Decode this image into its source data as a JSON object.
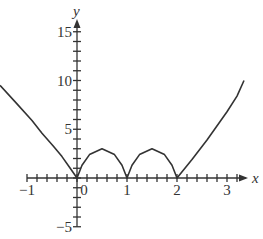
{
  "chart_data": {
    "type": "line",
    "title": "",
    "xlabel": "x",
    "ylabel": "y",
    "xlim": [
      -1.55,
      3.4
    ],
    "ylim": [
      -5.2,
      16.3
    ],
    "grid": false,
    "x_ticks": [
      -1,
      0,
      1,
      2,
      3
    ],
    "x_tick_labels": [
      "−1",
      "0",
      "1",
      "2",
      "3"
    ],
    "x_minor_tick_step": 0.2,
    "y_ticks": [
      -5,
      5,
      10,
      15
    ],
    "y_tick_labels": [
      "−5",
      "5",
      "10",
      "15"
    ],
    "y_minor_tick_step": 1,
    "series": [
      {
        "name": "f(x)",
        "color": "#333333",
        "points": [
          [
            -1.54,
            9.5
          ],
          [
            -1.2,
            7.6
          ],
          [
            -0.9,
            5.9
          ],
          [
            -0.7,
            4.6
          ],
          [
            -0.48,
            3.3
          ],
          [
            -0.3,
            2.2
          ],
          [
            -0.15,
            1.1
          ],
          [
            0,
            0
          ],
          [
            0.1,
            1.3
          ],
          [
            0.25,
            2.4
          ],
          [
            0.5,
            3.0
          ],
          [
            0.75,
            2.4
          ],
          [
            0.9,
            1.3
          ],
          [
            1,
            0
          ],
          [
            1.1,
            1.3
          ],
          [
            1.25,
            2.4
          ],
          [
            1.5,
            3.0
          ],
          [
            1.75,
            2.4
          ],
          [
            1.9,
            1.3
          ],
          [
            2,
            0
          ],
          [
            2.3,
            1.9
          ],
          [
            2.6,
            3.9
          ],
          [
            3.0,
            6.8
          ],
          [
            3.2,
            8.4
          ],
          [
            3.34,
            10.0
          ]
        ]
      }
    ]
  }
}
